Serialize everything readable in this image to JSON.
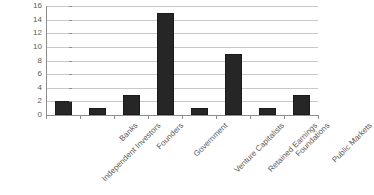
{
  "chart_data": {
    "type": "bar",
    "title": "",
    "subtitle": "",
    "xlabel": "",
    "ylabel": "",
    "categories": [
      "Independent Investors",
      "Banks",
      "Founders",
      "Government",
      "Venture Capitalists",
      "Retained Earnings",
      "Foundations",
      "Public Markets"
    ],
    "values": [
      2,
      1,
      3,
      15,
      1,
      9,
      1,
      3
    ],
    "ylim": [
      0,
      16
    ],
    "ytick_labels": [
      "0",
      "2",
      "4",
      "6",
      "8",
      "10",
      "12",
      "14",
      "16"
    ],
    "ytick_values": [
      0,
      2,
      4,
      6,
      8,
      10,
      12,
      14,
      16
    ],
    "grid": true,
    "legend": false,
    "legend_position": "none",
    "bar_color": "#262626",
    "gridline_color": "#c9c9c9",
    "axis_color": "#8d8d8d",
    "label_color": "#5a5a5a",
    "background_color": "#ffffff",
    "xtick_label_rotation": -45
  }
}
